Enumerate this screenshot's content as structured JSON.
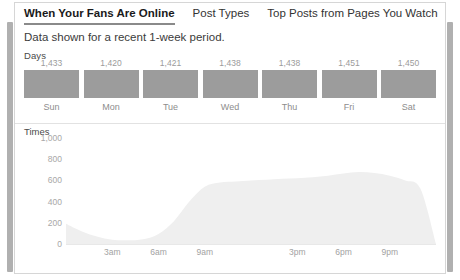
{
  "card": {
    "tabs": [
      {
        "label": "When Your Fans Are Online",
        "active": true
      },
      {
        "label": "Post Types",
        "active": false
      },
      {
        "label": "Top Posts from Pages You Watch",
        "active": false
      }
    ],
    "subtitle": "Data shown for a recent 1-week period.",
    "days_label": "Days",
    "times_label": "Times"
  },
  "chart_data": [
    {
      "type": "bar",
      "title": "Days",
      "xlabel": "",
      "ylabel": "",
      "categories": [
        "Sun",
        "Mon",
        "Tue",
        "Wed",
        "Thu",
        "Fri",
        "Sat"
      ],
      "values": [
        1433,
        1420,
        1421,
        1438,
        1438,
        1451,
        1450
      ],
      "value_labels": [
        "1,433",
        "1,420",
        "1,421",
        "1,438",
        "1,438",
        "1,451",
        "1,450"
      ],
      "bar_color": "#9c9c9c",
      "grid": false,
      "legend": "none"
    },
    {
      "type": "area",
      "title": "Times",
      "xlabel": "",
      "ylabel": "",
      "ylim": [
        0,
        1000
      ],
      "yticks": [
        1000,
        800,
        600,
        400,
        200,
        0
      ],
      "ytick_labels": [
        "1,000",
        "800",
        "600",
        "400",
        "200",
        "0"
      ],
      "xticks": [
        3,
        6,
        9,
        15,
        18,
        21
      ],
      "xtick_labels": [
        "3am",
        "6am",
        "9am",
        "3pm",
        "6pm",
        "9pm"
      ],
      "x_range": [
        0,
        24
      ],
      "x": [
        0,
        1,
        2,
        3,
        4,
        5,
        6,
        7,
        8,
        9,
        10,
        11,
        12,
        13,
        14,
        15,
        16,
        17,
        18,
        19,
        20,
        21,
        22,
        23,
        24
      ],
      "values": [
        190,
        120,
        70,
        40,
        35,
        45,
        95,
        215,
        400,
        540,
        580,
        590,
        600,
        605,
        615,
        620,
        630,
        645,
        665,
        680,
        670,
        645,
        600,
        520,
        0
      ],
      "fill_color": "#efefef",
      "grid": false,
      "legend": "none"
    }
  ]
}
